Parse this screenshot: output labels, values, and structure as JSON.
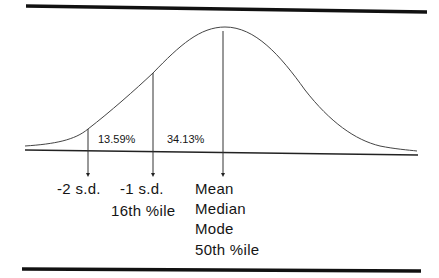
{
  "diagram": {
    "type": "normal-distribution-curve",
    "region_labels": {
      "minus2_to_minus1": "13.59%",
      "minus1_to_mean": "34.13%"
    },
    "markers": [
      {
        "id": "minus2sd",
        "lines": [
          "-2 s.d."
        ]
      },
      {
        "id": "minus1sd",
        "lines": [
          "-1 s.d.",
          "16th %ile"
        ]
      },
      {
        "id": "mean",
        "lines": [
          "Mean",
          "Median",
          "Mode",
          "50th %ile"
        ]
      }
    ],
    "colors": {
      "line": "#1a1a1a",
      "curve": "#444444",
      "background": "#ffffff"
    }
  }
}
